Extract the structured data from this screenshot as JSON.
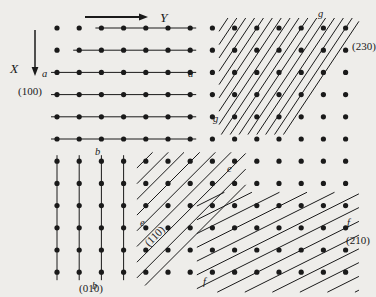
{
  "figure": {
    "background_color": "#eeedea",
    "ink_color": "#1a1a1a",
    "width": 376,
    "height": 297,
    "lattice": {
      "dot_radius": 2.6,
      "spacing_x": 22.2,
      "spacing_y": 22.2,
      "origin_x": 57,
      "origin_y": 28,
      "cols": 14,
      "rows": 12
    },
    "axes": {
      "y_axis": {
        "label": "Y",
        "arrow": "horizontal-right",
        "x1": 85,
        "y1": 17,
        "x2": 148,
        "y2": 17,
        "label_x": 160,
        "label_y": 22
      },
      "x_axis": {
        "label": "X",
        "arrow": "vertical-down",
        "x1": 35,
        "y1": 30,
        "x2": 35,
        "y2": 76,
        "label_x": 10,
        "label_y": 73
      }
    },
    "plane_families": [
      {
        "id": "100",
        "miller": "(100)",
        "point_label": "a",
        "description": "horizontal lines, one lattice row apart",
        "miller_label_x": 18,
        "miller_label_y": 95,
        "label_left_x": 42,
        "label_left_y": 77,
        "label_right_x": 188,
        "label_right_y": 77
      },
      {
        "id": "010",
        "miller": "(010)",
        "point_label": "b",
        "description": "vertical lines, one lattice column apart",
        "miller_label_x": 79,
        "miller_label_y": 292,
        "label_top_x": 95,
        "label_top_y": 155,
        "label_bottom_x": 92,
        "label_bottom_y": 289
      },
      {
        "id": "110",
        "miller": "(110)",
        "point_label": "e",
        "description": "diagonal lines of slope -1 through lattice points",
        "miller_label_x": 149,
        "miller_label_y": 247,
        "miller_label_rotation": -45,
        "label_upper_x": 227,
        "label_upper_y": 172,
        "label_lower_x": 140,
        "label_lower_y": 226
      },
      {
        "id": "210",
        "miller": "(210)",
        "point_label": "f",
        "description": "shallow diagonal lines, intercepts 1 and 2",
        "miller_label_x": 346,
        "miller_label_y": 244,
        "label_upper_x": 347,
        "label_upper_y": 226,
        "label_lower_x": 203,
        "label_lower_y": 285
      },
      {
        "id": "230",
        "miller": "(230)",
        "point_label": "g",
        "description": "steeper diagonal lines, intercepts 3 and 2",
        "miller_label_x": 352,
        "miller_label_y": 50,
        "label_upper_x": 318,
        "label_upper_y": 17,
        "label_lower_x": 213,
        "label_lower_y": 122
      }
    ]
  }
}
